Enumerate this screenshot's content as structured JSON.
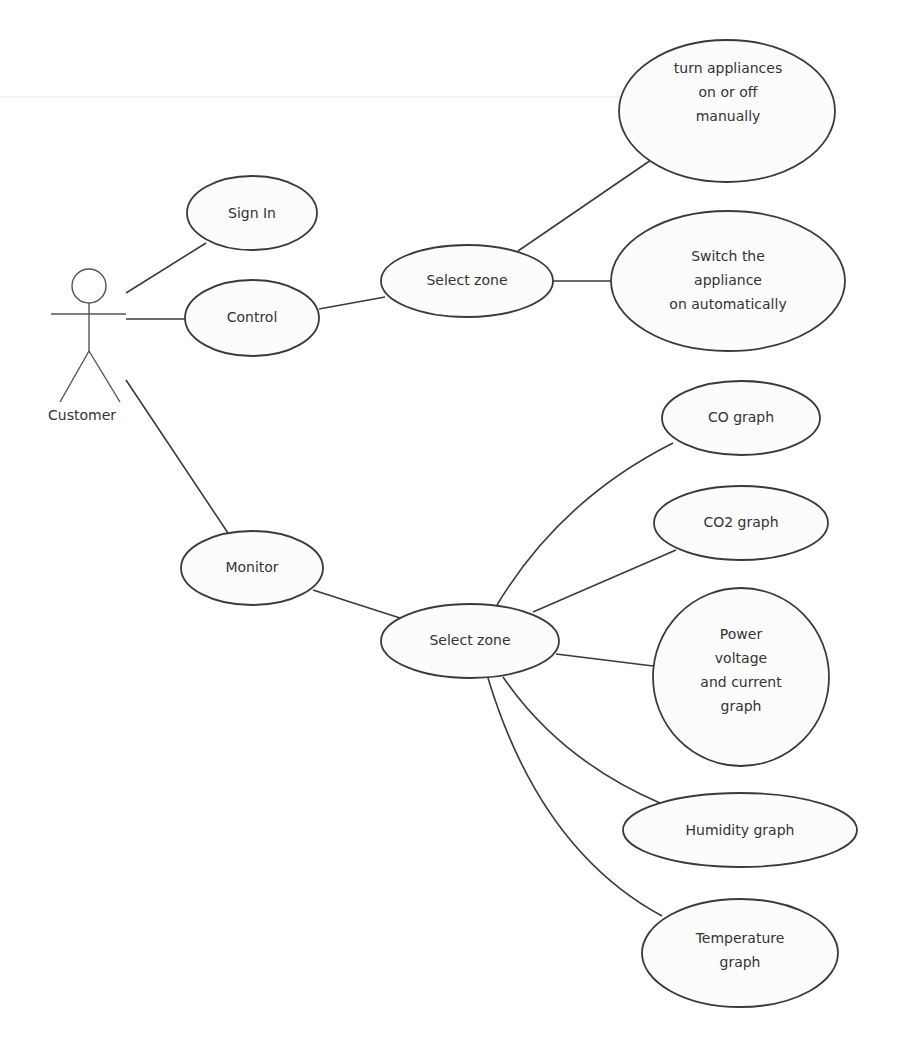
{
  "diagram": {
    "type": "use-case",
    "actor": {
      "name": "Customer"
    },
    "use_cases": {
      "sign_in": "Sign In",
      "control": "Control",
      "monitor": "Monitor",
      "control_select_zone": "Select zone",
      "monitor_select_zone": "Select zone",
      "turn_manual": [
        "turn appliances",
        "on or off",
        "manually"
      ],
      "switch_auto": [
        "Switch the",
        "appliance",
        "on automatically"
      ],
      "co_graph": "CO graph",
      "co2_graph": "CO2 graph",
      "power_graph": [
        "Power",
        "voltage",
        "and current",
        "graph"
      ],
      "humidity_graph": "Humidity graph",
      "temperature_graph": [
        "Temperature",
        "graph"
      ]
    },
    "associations": [
      [
        "Customer",
        "Sign In"
      ],
      [
        "Customer",
        "Control"
      ],
      [
        "Customer",
        "Monitor"
      ],
      [
        "Control",
        "Select zone"
      ],
      [
        "Select zone",
        "turn appliances on or off manually"
      ],
      [
        "Select zone",
        "Switch the appliance on automatically"
      ],
      [
        "Monitor",
        "Select zone"
      ],
      [
        "Select zone",
        "CO graph"
      ],
      [
        "Select zone",
        "CO2 graph"
      ],
      [
        "Select zone",
        "Power voltage and current graph"
      ],
      [
        "Select zone",
        "Humidity graph"
      ],
      [
        "Select zone",
        "Temperature graph"
      ]
    ],
    "colors": {
      "stroke": "#3a3a3a",
      "fill": "#fcfcfc",
      "text": "#333333"
    }
  }
}
